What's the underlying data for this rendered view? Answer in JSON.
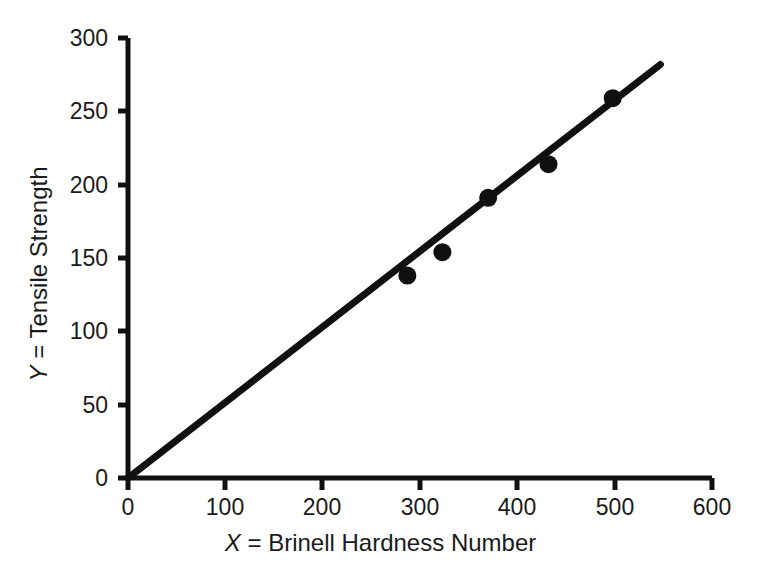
{
  "chart_data": {
    "type": "scatter",
    "title": "",
    "xlabel": "X = Brinell Hardness Number",
    "ylabel": "Y = Tensile Strength",
    "xlabel_var": "X",
    "xlabel_rest": " = Brinell Hardness Number",
    "ylabel_var": "Y",
    "ylabel_rest": " = Tensile Strength",
    "xlim": [
      0,
      600
    ],
    "ylim": [
      0,
      300
    ],
    "xticks": [
      0,
      100,
      200,
      300,
      400,
      500,
      600
    ],
    "xtick_labels": [
      "0",
      "100",
      "200",
      "300",
      "400",
      "500",
      "600"
    ],
    "yticks": [
      0,
      50,
      100,
      150,
      200,
      250,
      300
    ],
    "ytick_labels": [
      "0",
      "50",
      "100",
      "150",
      "200",
      "250",
      "300"
    ],
    "grid": false,
    "legend": false,
    "marker_color": "#101010",
    "line_color": "#101010",
    "axis_color": "#101010",
    "background": "#ffffff",
    "series": [
      {
        "name": "observations",
        "style": "points",
        "marker": "filled-circle",
        "points": [
          {
            "x": 287,
            "y": 138
          },
          {
            "x": 323,
            "y": 154
          },
          {
            "x": 370,
            "y": 191
          },
          {
            "x": 432,
            "y": 214
          },
          {
            "x": 498,
            "y": 259
          }
        ]
      },
      {
        "name": "fitted-regression-line",
        "style": "line",
        "x": [
          0,
          547
        ],
        "y": [
          0,
          282
        ],
        "slope": 0.515,
        "intercept": 0
      }
    ]
  }
}
